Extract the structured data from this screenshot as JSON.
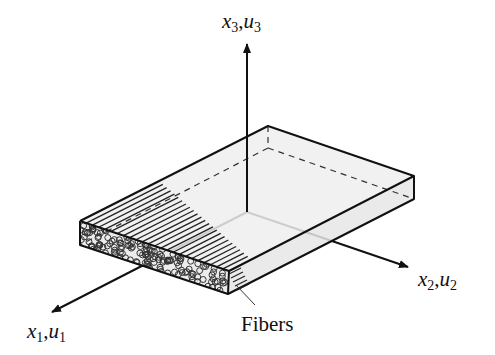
{
  "diagram": {
    "axes": [
      {
        "id": "x3",
        "var1": "x",
        "sub1": "3",
        "var2": "u",
        "sub2": "3",
        "direction": "up"
      },
      {
        "id": "x2",
        "var1": "x",
        "sub1": "2",
        "var2": "u",
        "sub2": "2",
        "direction": "right-down"
      },
      {
        "id": "x1",
        "var1": "x",
        "sub1": "1",
        "var2": "u",
        "sub2": "1",
        "direction": "left-down"
      }
    ],
    "callout": {
      "label": "Fibers"
    },
    "colors": {
      "line": "#111111",
      "top_face": "#efefef",
      "side_face": "#e6e6e6",
      "background": "#ffffff"
    }
  }
}
